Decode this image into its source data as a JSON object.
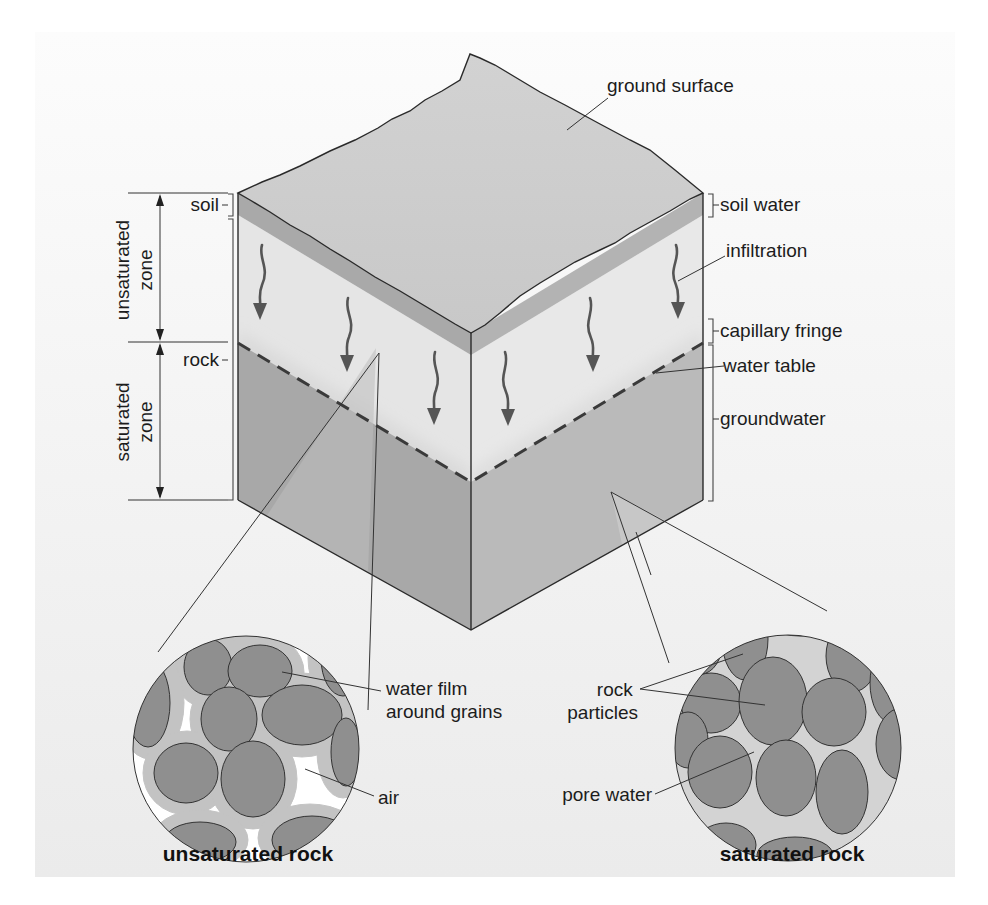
{
  "figure": {
    "type": "block diagram",
    "colors": {
      "panel_top": "#fbfbfb",
      "panel_bottom": "#ececec",
      "ground_surface": "#cfcfcf",
      "soil_layer": "#a9a9a9",
      "unsaturated_rock": "#e4e4e4",
      "saturated_rock_left": "#a6a6a6",
      "saturated_rock_right": "#b9b9b9",
      "grain": "#8d8d8d",
      "water_film": "#c3c3c3",
      "pore_water": "#d4d4d4",
      "arrow": "#555555"
    }
  },
  "labels": {
    "ground_surface": "ground surface",
    "soil": "soil",
    "rock": "rock",
    "unsaturated_zone": [
      "unsaturated",
      "zone"
    ],
    "saturated_zone": [
      "saturated",
      "zone"
    ],
    "soil_water": "soil water",
    "infiltration": "infiltration",
    "capillary_fringe": "capillary fringe",
    "water_table": "water table",
    "groundwater": "groundwater"
  },
  "insets": {
    "unsaturated": {
      "title": "unsaturated rock",
      "callouts": {
        "water_film": [
          "water film",
          "around grains"
        ],
        "air": "air"
      }
    },
    "saturated": {
      "title": "saturated rock",
      "callouts": {
        "rock_particles": [
          "rock",
          "particles"
        ],
        "pore_water": "pore water"
      }
    }
  }
}
